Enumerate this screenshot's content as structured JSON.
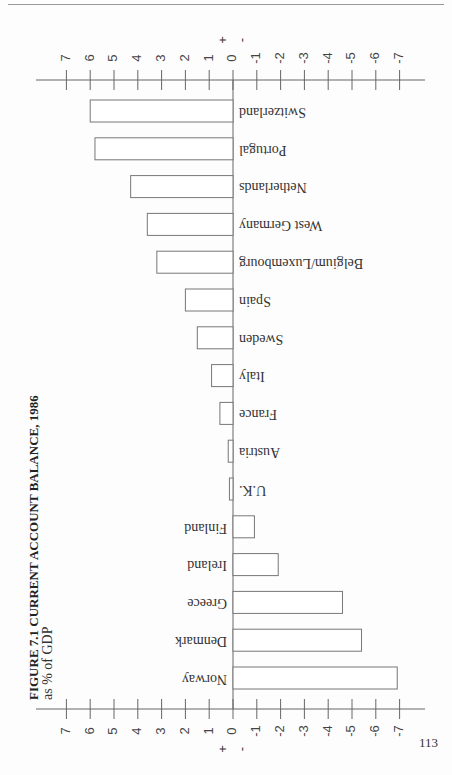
{
  "page": {
    "figure_title": "FIGURE 7.1    CURRENT ACCOUNT BALANCE, 1986",
    "subtitle": "as % of GDP",
    "page_number": "113"
  },
  "chart_data": {
    "type": "bar",
    "orientation": "horizontal",
    "title": "FIGURE 7.1 CURRENT ACCOUNT BALANCE, 1986",
    "subtitle": "as % of GDP",
    "xlabel": "as % of GDP",
    "ylabel": "",
    "xlim": [
      7,
      -7
    ],
    "x_ticks": [
      7,
      6,
      5,
      4,
      3,
      2,
      1,
      0,
      -1,
      -2,
      -3,
      -4,
      -5,
      -6,
      -7
    ],
    "x_tick_labels": [
      "7",
      "6",
      "5",
      "4",
      "3",
      "2",
      "1",
      "0",
      "-1",
      "-2",
      "-3",
      "-4",
      "-5",
      "-6",
      "-7"
    ],
    "sign_labels": {
      "positive": "+",
      "negative": "-"
    },
    "grid": false,
    "legend": "none",
    "categories": [
      "Switzerland",
      "Portugal",
      "Netherlands",
      "West Germany",
      "Belgium/Luxembourg",
      "Spain",
      "Sweden",
      "Italy",
      "France",
      "Austria",
      "U.K.",
      "Finland",
      "Ireland",
      "Greece",
      "Denmark",
      "Norway"
    ],
    "values": [
      6.0,
      5.8,
      4.3,
      3.6,
      3.2,
      2.0,
      1.5,
      0.9,
      0.55,
      0.2,
      0.15,
      -0.9,
      -1.9,
      -4.6,
      -5.4,
      -6.9
    ]
  }
}
